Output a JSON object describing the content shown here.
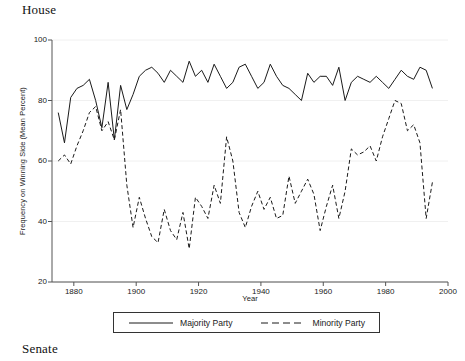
{
  "figure": {
    "panel_title_top": "House",
    "panel_title_bottom": "Senate"
  },
  "chart_data": {
    "type": "line",
    "title": "House",
    "xlabel": "Year",
    "ylabel": "Frequency on Winning Side (Mean Percent)",
    "xlim": [
      1873,
      2000
    ],
    "ylim": [
      20,
      100
    ],
    "xticks": [
      1880,
      1900,
      1920,
      1940,
      1960,
      1980,
      2000
    ],
    "yticks": [
      20,
      40,
      60,
      80,
      100
    ],
    "grid": true,
    "legend_position": "below-axis",
    "x": [
      1875,
      1877,
      1879,
      1881,
      1883,
      1885,
      1887,
      1889,
      1891,
      1893,
      1895,
      1897,
      1899,
      1901,
      1903,
      1905,
      1907,
      1909,
      1911,
      1913,
      1915,
      1917,
      1919,
      1921,
      1923,
      1925,
      1927,
      1929,
      1931,
      1933,
      1935,
      1937,
      1939,
      1941,
      1943,
      1945,
      1947,
      1949,
      1951,
      1953,
      1955,
      1957,
      1959,
      1961,
      1963,
      1965,
      1967,
      1969,
      1971,
      1973,
      1975,
      1977,
      1979,
      1981,
      1983,
      1985,
      1987,
      1989,
      1991,
      1993,
      1995
    ],
    "series": [
      {
        "name": "Majority Party",
        "style": "solid",
        "color": "#1a1a1a",
        "values": [
          76,
          66,
          81,
          84,
          85,
          87,
          80,
          71,
          86,
          67,
          85,
          77,
          82,
          88,
          90,
          91,
          89,
          86,
          90,
          88,
          86,
          93,
          88,
          90,
          86,
          92,
          88,
          84,
          86,
          91,
          92,
          88,
          84,
          86,
          92,
          88,
          85,
          84,
          82,
          80,
          89,
          86,
          88,
          88,
          85,
          91,
          80,
          86,
          88,
          87,
          86,
          88,
          86,
          84,
          87,
          90,
          88,
          87,
          91,
          90,
          84
        ]
      },
      {
        "name": "Minority Party",
        "style": "dashed",
        "color": "#1a1a1a",
        "values": [
          60,
          62,
          59,
          65,
          70,
          76,
          78,
          70,
          73,
          67,
          77,
          52,
          38,
          48,
          41,
          35,
          33,
          44,
          37,
          34,
          43,
          31,
          48,
          45,
          41,
          52,
          46,
          68,
          60,
          43,
          38,
          45,
          50,
          44,
          48,
          41,
          42,
          55,
          46,
          50,
          54,
          49,
          37,
          45,
          52,
          41,
          50,
          64,
          62,
          63,
          65,
          60,
          68,
          74,
          80,
          79,
          70,
          72,
          66,
          41,
          53
        ]
      }
    ]
  },
  "legend": {
    "items": [
      {
        "label": "Majority Party",
        "style": "solid"
      },
      {
        "label": "Minority Party",
        "style": "dashed"
      }
    ]
  }
}
